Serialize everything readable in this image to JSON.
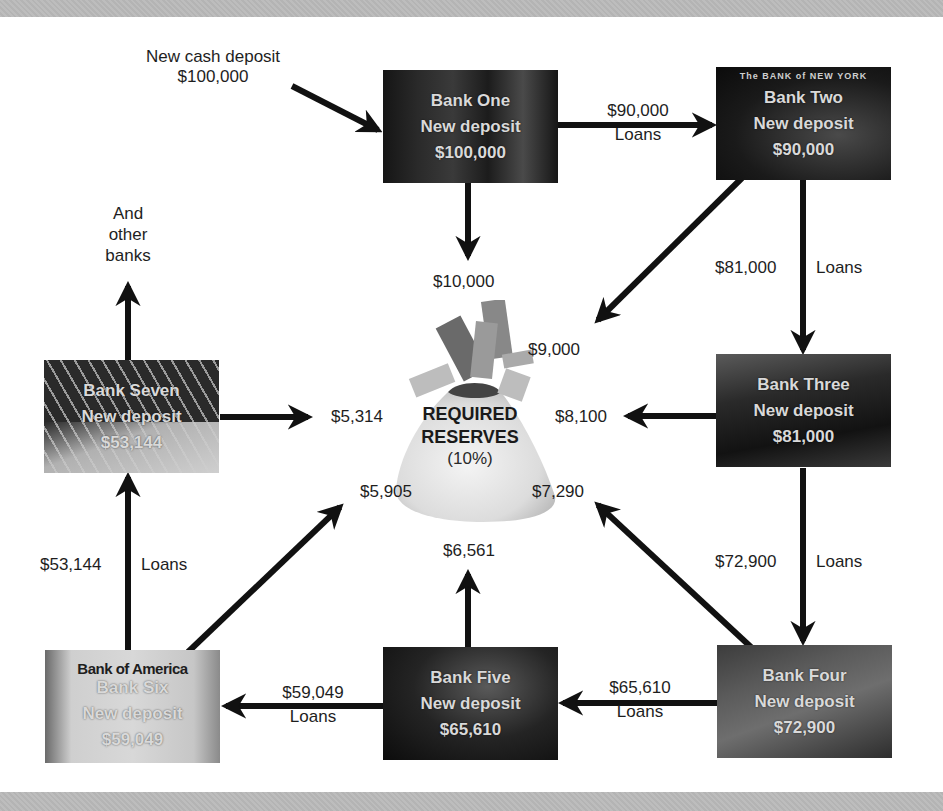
{
  "diagram": {
    "title_center": {
      "line1": "REQUIRED",
      "line2": "RESERVES",
      "line3": "(10%)"
    },
    "initial_deposit": {
      "line1": "New cash deposit",
      "line2": "$100,000"
    },
    "other_banks": {
      "line1": "And",
      "line2": "other",
      "line3": "banks"
    },
    "banks": [
      {
        "name": "Bank One",
        "deposit_label": "New deposit",
        "amount": "$100,000",
        "photo_caption": ""
      },
      {
        "name": "Bank Two",
        "deposit_label": "New deposit",
        "amount": "$90,000",
        "photo_caption": "The BANK of NEW YORK"
      },
      {
        "name": "Bank Three",
        "deposit_label": "New deposit",
        "amount": "$81,000",
        "photo_caption": ""
      },
      {
        "name": "Bank Four",
        "deposit_label": "New deposit",
        "amount": "$72,900",
        "photo_caption": ""
      },
      {
        "name": "Bank Five",
        "deposit_label": "New deposit",
        "amount": "$65,610",
        "photo_caption": ""
      },
      {
        "name": "Bank Six",
        "deposit_label": "New deposit",
        "amount": "$59,049",
        "photo_caption": "Bank of America"
      },
      {
        "name": "Bank Seven",
        "deposit_label": "New deposit",
        "amount": "$53,144",
        "photo_caption": ""
      }
    ],
    "loans": [
      {
        "amount": "$90,000",
        "label": "Loans"
      },
      {
        "amount": "$81,000",
        "label": "Loans"
      },
      {
        "amount": "$72,900",
        "label": "Loans"
      },
      {
        "amount": "$65,610",
        "label": "Loans"
      },
      {
        "amount": "$59,049",
        "label": "Loans"
      },
      {
        "amount": "$53,144",
        "label": "Loans"
      }
    ],
    "reserves": [
      {
        "from": "Bank One",
        "amount": "$10,000"
      },
      {
        "from": "Bank Two",
        "amount": "$9,000"
      },
      {
        "from": "Bank Three",
        "amount": "$8,100"
      },
      {
        "from": "Bank Four",
        "amount": "$7,290"
      },
      {
        "from": "Bank Five",
        "amount": "$6,561"
      },
      {
        "from": "Bank Six",
        "amount": "$5,905"
      },
      {
        "from": "Bank Seven",
        "amount": "$5,314"
      }
    ]
  }
}
